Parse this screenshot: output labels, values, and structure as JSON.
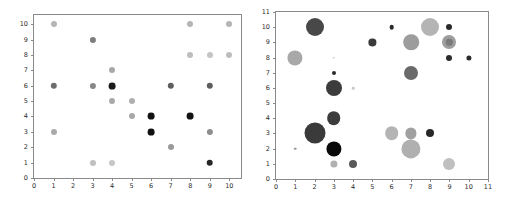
{
  "figure": {
    "background": "#ffffff",
    "panel_count": 2
  },
  "chart_data": [
    {
      "type": "scatter",
      "id": "left-scatter",
      "title": "",
      "xlabel": "",
      "ylabel": "",
      "xlim": [
        0,
        10.6
      ],
      "ylim": [
        0,
        10.6
      ],
      "xticks": [
        0,
        1,
        2,
        3,
        4,
        5,
        6,
        7,
        8,
        9,
        10
      ],
      "yticks": [
        0,
        1,
        2,
        3,
        4,
        5,
        6,
        7,
        8,
        9,
        10
      ],
      "xticklabels": [
        "0",
        "1",
        "2",
        "3",
        "4",
        "5",
        "6",
        "7",
        "8",
        "9",
        "10"
      ],
      "yticklabels": [
        "0",
        "1",
        "2",
        "3",
        "4",
        "5",
        "6",
        "7",
        "8",
        "9",
        "10"
      ],
      "grid": false,
      "legend": null,
      "marker": "circle",
      "marker_size_fixed": 3.2,
      "colormap": "grayscale",
      "points": [
        {
          "x": 1,
          "y": 10,
          "color": "#b5b5b5",
          "r": 3.0
        },
        {
          "x": 8,
          "y": 10,
          "color": "#b5b5b5",
          "r": 3.0
        },
        {
          "x": 10,
          "y": 10,
          "color": "#b5b5b5",
          "r": 3.0
        },
        {
          "x": 3,
          "y": 9,
          "color": "#7d7d7d",
          "r": 3.1
        },
        {
          "x": 8,
          "y": 8,
          "color": "#bdbdbd",
          "r": 3.0
        },
        {
          "x": 9,
          "y": 8,
          "color": "#c4c4c4",
          "r": 3.0
        },
        {
          "x": 10,
          "y": 8,
          "color": "#bdbdbd",
          "r": 3.0
        },
        {
          "x": 4,
          "y": 7,
          "color": "#a8a8a8",
          "r": 3.0
        },
        {
          "x": 1,
          "y": 6,
          "color": "#6e6e6e",
          "r": 3.2
        },
        {
          "x": 3,
          "y": 6,
          "color": "#888888",
          "r": 3.1
        },
        {
          "x": 4,
          "y": 6,
          "color": "#1a1a1a",
          "r": 3.4
        },
        {
          "x": 7,
          "y": 6,
          "color": "#5e5e5e",
          "r": 3.2
        },
        {
          "x": 9,
          "y": 6,
          "color": "#5e5e5e",
          "r": 3.2
        },
        {
          "x": 4,
          "y": 5,
          "color": "#a8a8a8",
          "r": 3.0
        },
        {
          "x": 5,
          "y": 5,
          "color": "#b0b0b0",
          "r": 3.0
        },
        {
          "x": 5,
          "y": 4,
          "color": "#a8a8a8",
          "r": 3.0
        },
        {
          "x": 6,
          "y": 4,
          "color": "#121212",
          "r": 3.4
        },
        {
          "x": 8,
          "y": 4,
          "color": "#121212",
          "r": 3.4
        },
        {
          "x": 1,
          "y": 3,
          "color": "#aaaaaa",
          "r": 3.0
        },
        {
          "x": 6,
          "y": 3,
          "color": "#101010",
          "r": 3.4
        },
        {
          "x": 9,
          "y": 3,
          "color": "#8e8e8e",
          "r": 3.1
        },
        {
          "x": 7,
          "y": 2,
          "color": "#9a9a9a",
          "r": 3.0
        },
        {
          "x": 3,
          "y": 1,
          "color": "#c0c0c0",
          "r": 3.0
        },
        {
          "x": 4,
          "y": 1,
          "color": "#c6c6c6",
          "r": 3.0
        },
        {
          "x": 9,
          "y": 1,
          "color": "#262626",
          "r": 3.3
        }
      ]
    },
    {
      "type": "scatter",
      "id": "right-scatter",
      "title": "",
      "xlabel": "",
      "ylabel": "",
      "xlim": [
        0,
        11
      ],
      "ylim": [
        0,
        11
      ],
      "xticks": [
        0,
        1,
        2,
        3,
        4,
        5,
        6,
        7,
        8,
        9,
        10,
        11
      ],
      "yticks": [
        0,
        1,
        2,
        3,
        4,
        5,
        6,
        7,
        8,
        9,
        10,
        11
      ],
      "xticklabels": [
        "0",
        "1",
        "2",
        "3",
        "4",
        "5",
        "6",
        "7",
        "8",
        "9",
        "10",
        "11"
      ],
      "yticklabels": [
        "0",
        "1",
        "2",
        "3",
        "4",
        "5",
        "6",
        "7",
        "8",
        "9",
        "10",
        "11"
      ],
      "grid": false,
      "legend": null,
      "marker": "circle",
      "marker_size_varies": true,
      "colormap": "grayscale",
      "points": [
        {
          "x": 2,
          "y": 10,
          "color": "#484848",
          "r": 9.0
        },
        {
          "x": 6,
          "y": 10,
          "color": "#2b2b2b",
          "r": 2.3
        },
        {
          "x": 8,
          "y": 10,
          "color": "#b4b4b4",
          "r": 9.0
        },
        {
          "x": 9,
          "y": 10,
          "color": "#2b2b2b",
          "r": 3.0
        },
        {
          "x": 5,
          "y": 9,
          "color": "#3a3a3a",
          "r": 3.6
        },
        {
          "x": 7,
          "y": 9,
          "color": "#9d9d9d",
          "r": 7.8
        },
        {
          "x": 9,
          "y": 9,
          "color": "#9d9d9d",
          "r": 7.0
        },
        {
          "x": 9,
          "y": 9,
          "color": "#7a7a7a",
          "r": 3.2
        },
        {
          "x": 1,
          "y": 8,
          "color": "#a8a8a8",
          "r": 7.6
        },
        {
          "x": 3,
          "y": 8,
          "color": "#d2d2d2",
          "r": 1.3
        },
        {
          "x": 9,
          "y": 8,
          "color": "#2b2b2b",
          "r": 3.0
        },
        {
          "x": 10,
          "y": 8,
          "color": "#2b2b2b",
          "r": 2.6
        },
        {
          "x": 7,
          "y": 7,
          "color": "#6a6a6a",
          "r": 7.0
        },
        {
          "x": 3,
          "y": 7,
          "color": "#2b2b2b",
          "r": 2.0
        },
        {
          "x": 3,
          "y": 6,
          "color": "#3c3c3c",
          "r": 8.0
        },
        {
          "x": 4,
          "y": 6,
          "color": "#c8c8c8",
          "r": 1.3
        },
        {
          "x": 3,
          "y": 4,
          "color": "#3c3c3c",
          "r": 6.8
        },
        {
          "x": 2,
          "y": 3,
          "color": "#3a3a3a",
          "r": 10.5
        },
        {
          "x": 6,
          "y": 3,
          "color": "#b4b4b4",
          "r": 6.8
        },
        {
          "x": 7,
          "y": 3,
          "color": "#a0a0a0",
          "r": 5.6
        },
        {
          "x": 8,
          "y": 3,
          "color": "#282828",
          "r": 4.0
        },
        {
          "x": 3,
          "y": 2,
          "color": "#0a0a0a",
          "r": 7.6
        },
        {
          "x": 1,
          "y": 2,
          "color": "#9a9a9a",
          "r": 1.3
        },
        {
          "x": 7,
          "y": 2,
          "color": "#b0b0b0",
          "r": 9.6
        },
        {
          "x": 3,
          "y": 1,
          "color": "#b0b0b0",
          "r": 3.6
        },
        {
          "x": 4,
          "y": 1,
          "color": "#5a5a5a",
          "r": 4.0
        },
        {
          "x": 9,
          "y": 1,
          "color": "#c0c0c0",
          "r": 6.0
        }
      ]
    }
  ]
}
